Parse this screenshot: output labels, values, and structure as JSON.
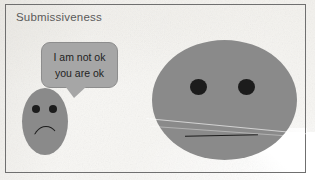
{
  "image": {
    "kind": "cartoon-panel",
    "width": 315,
    "height": 180,
    "title": "Submissiveness"
  },
  "panel": {
    "title": "Submissiveness",
    "border_color": "#6f6f6f",
    "background_color": "#f7f6f3"
  },
  "speech_bubble": {
    "speaker": "small-face",
    "fill_color": "#a6a6a6",
    "text_color": "#1f1f1f",
    "lines": [
      "I am not ok",
      "you are ok"
    ],
    "line1": "I am not ok",
    "line2": "you are ok"
  },
  "characters": [
    {
      "id": "small-face",
      "role": "submissive-speaker",
      "size": "small",
      "shape": "vertical-oval",
      "fill_color": "#8a8a8a",
      "expression": "sad",
      "mouth": "frown",
      "eyes": 2
    },
    {
      "id": "big-face",
      "role": "listener",
      "size": "large",
      "shape": "wide-oval",
      "fill_color": "#8a8a8a",
      "expression": "neutral",
      "mouth": "straight-line",
      "eyes": 2
    }
  ],
  "artifacts": {
    "paper_crease": "diagonal fold line across lower large face",
    "torn_corner": "bottom-right white torn paper area"
  }
}
